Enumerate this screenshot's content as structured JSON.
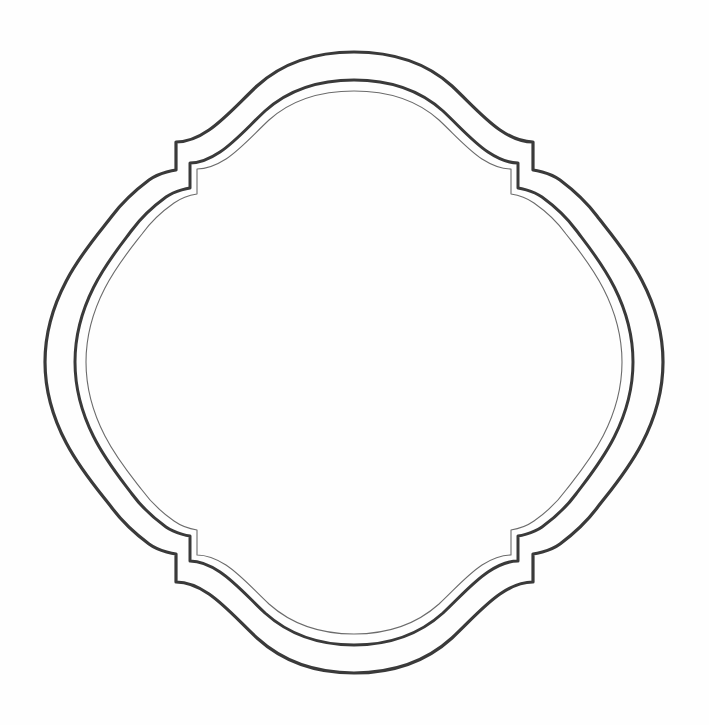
{
  "document": {
    "title": "Decorative Ornamental Frame Outline",
    "subject": "scalloped quatrefoil badge frame",
    "background_color": "#fefefe",
    "canvas_width": 709,
    "canvas_height": 725,
    "text_content": "",
    "visible_labels": []
  },
  "artwork": {
    "name": "ornamental-frame",
    "style": "line-art outline drawing",
    "contour_count": 3,
    "symmetry": "bilateral horizontal and vertical",
    "ink_color": "#3a3a3a",
    "ink_color_light": "#6b6b6b",
    "contours": [
      {
        "id": "outer-contour",
        "label": "Outer border",
        "stroke_color": "#3a3a3a",
        "stroke_width": 3.2,
        "bounds": {
          "left": 45,
          "top": 52,
          "right": 663,
          "bottom": 673
        },
        "path": "M 354 52 C 399 52 430 66 452 86 C 470 103 484 119 500 130 C 513 139 524 142 533 142 L 533 170 C 533 170 549 172 560 180 C 572 189 585 200 597 216 C 616 241 663 291 663 362 C 663 433 616 483 597 508 C 585 524 572 535 560 544 C 549 552 533 554 533 554 L 533 582 C 524 582 513 585 500 594 C 484 605 470 621 452 638 C 430 658 399 673 354 673 C 309 673 279 658 257 638 C 239 621 225 605 209 594 C 196 585 185 582 176 582 L 176 554 C 176 554 160 552 149 544 C 137 535 124 524 112 508 C 93 483 45 433 45 362 C 45 291 93 241 112 216 C 124 200 137 189 149 180 C 160 172 176 170 176 170 L 176 142 C 185 142 196 139 209 130 C 225 119 239 103 257 86 C 279 66 309 52 354 52 Z"
      },
      {
        "id": "middle-contour",
        "label": "Inner border",
        "stroke_color": "#3a3a3a",
        "stroke_width": 3.0,
        "bounds": {
          "left": 75,
          "top": 80,
          "right": 633,
          "bottom": 645
        },
        "path": "M 354 80 C 395 80 423 93 443 111 C 460 127 473 142 488 152 C 500 160 510 163 518 163 L 518 188 C 518 188 532 190 542 197 C 553 205 565 215 576 230 C 593 253 633 298 633 362 C 633 426 593 471 576 494 C 565 509 553 519 542 527 C 532 534 518 536 518 536 L 518 561 C 510 561 500 564 488 572 C 473 582 460 597 443 613 C 423 631 395 645 354 645 C 313 645 285 631 265 613 C 248 597 235 582 220 572 C 208 564 198 561 190 561 L 190 536 C 190 536 176 534 166 527 C 155 519 143 509 132 494 C 115 471 75 426 75 362 C 75 298 115 253 132 230 C 143 215 155 205 166 197 C 176 190 190 188 190 188 L 190 163 C 198 163 208 160 220 152 C 235 142 248 127 265 111 C 285 93 313 80 354 80 Z"
      },
      {
        "id": "inner-hairline-contour",
        "label": "Hairline accent",
        "stroke_color": "#6b6b6b",
        "stroke_width": 1.1,
        "bounds": {
          "left": 86,
          "top": 91,
          "right": 622,
          "bottom": 634
        },
        "path": "M 354 91 C 393 91 420 103 439 120 C 455 135 467 149 482 159 C 493 166 503 169 511 169 L 511 194 C 511 194 524 196 534 203 C 544 210 556 220 566 234 C 583 256 622 300 622 362 C 622 424 583 468 566 490 C 556 504 544 514 534 521 C 524 528 511 530 511 530 L 511 555 C 503 555 493 558 482 565 C 467 575 455 589 439 604 C 420 621 393 634 354 634 C 315 634 288 621 269 604 C 253 589 241 575 226 565 C 215 558 205 555 197 555 L 197 530 C 197 530 184 528 174 521 C 164 514 152 504 142 490 C 125 468 86 424 86 362 C 86 300 125 256 142 234 C 152 220 164 210 174 203 C 184 196 197 194 197 194 L 197 169 C 205 169 215 166 226 159 C 241 149 253 135 269 120 C 288 103 315 91 354 91 Z"
      }
    ]
  }
}
